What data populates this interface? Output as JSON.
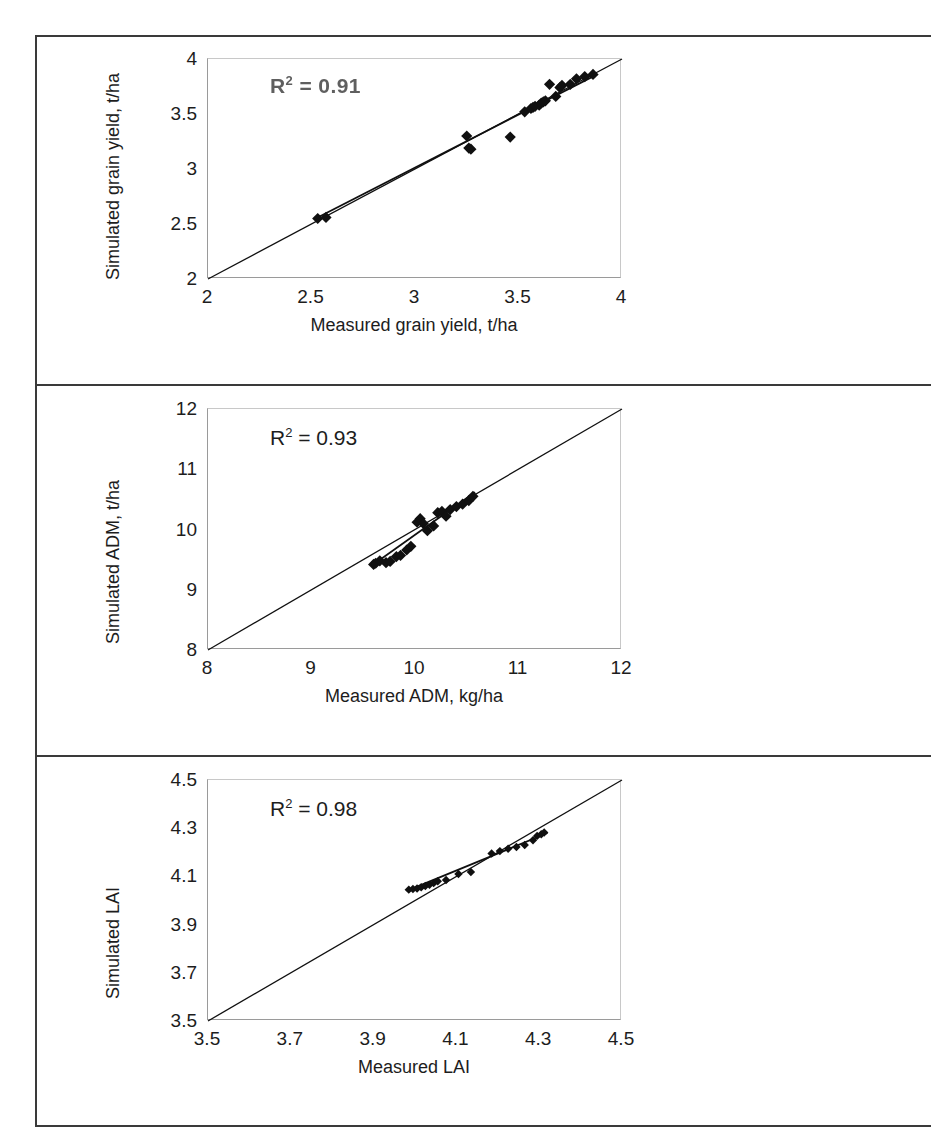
{
  "figure": {
    "type": "multi-panel-scatter-figure",
    "panel_count": 3,
    "frame_color": "#3a3a3a",
    "marker_color": "#101010",
    "line_color": "#101010"
  },
  "chart_data": [
    {
      "type": "scatter",
      "panel": 1,
      "title": "",
      "xlabel": "Measured grain yield, t/ha",
      "ylabel": "Simulated grain yield, t/ha",
      "xlim": [
        2,
        4
      ],
      "ylim": [
        2,
        4
      ],
      "xticks": [
        "2",
        "2.5",
        "3",
        "3.5",
        "4"
      ],
      "xtick_values": [
        2,
        2.5,
        3,
        3.5,
        4
      ],
      "yticks": [
        "2",
        "2.5",
        "3",
        "3.5",
        "4"
      ],
      "ytick_values": [
        2,
        2.5,
        3,
        3.5,
        4
      ],
      "grid": false,
      "legend": "none",
      "annotation": "R2 = 0.91",
      "annotation_r": "R",
      "annotation_sup": "2",
      "annotation_rest": " = 0.91",
      "annotation_note": "faint/degraded print, renders close to 'R2 = 0.91'",
      "reference_line": {
        "name": "1:1 line",
        "from": [
          2,
          2
        ],
        "to": [
          4,
          4
        ]
      },
      "fit_line": {
        "name": "regression line",
        "from": [
          2.52,
          2.55
        ],
        "to": [
          3.88,
          3.86
        ]
      },
      "points_x": [
        2.53,
        2.57,
        3.25,
        3.26,
        3.27,
        3.46,
        3.53,
        3.56,
        3.57,
        3.58,
        3.6,
        3.61,
        3.62,
        3.63,
        3.65,
        3.68,
        3.7,
        3.71,
        3.75,
        3.78,
        3.82,
        3.86
      ],
      "points_y": [
        2.55,
        2.56,
        3.3,
        3.19,
        3.18,
        3.29,
        3.52,
        3.55,
        3.56,
        3.57,
        3.58,
        3.6,
        3.61,
        3.62,
        3.77,
        3.66,
        3.74,
        3.76,
        3.77,
        3.82,
        3.84,
        3.86
      ]
    },
    {
      "type": "scatter",
      "panel": 2,
      "title": "",
      "xlabel": "Measured ADM, kg/ha",
      "ylabel": "Simulated ADM, t/ha",
      "xlim": [
        8,
        12
      ],
      "ylim": [
        8,
        12
      ],
      "xticks": [
        "8",
        "9",
        "10",
        "11",
        "12"
      ],
      "xtick_values": [
        8,
        9,
        10,
        11,
        12
      ],
      "yticks": [
        "8",
        "9",
        "10",
        "11",
        "12"
      ],
      "ytick_values": [
        8,
        9,
        10,
        11,
        12
      ],
      "grid": false,
      "legend": "none",
      "annotation": "R2 = 0.93",
      "annotation_r": "R",
      "annotation_sup": "2",
      "annotation_rest": " = 0.93",
      "reference_line": {
        "name": "1:1 line",
        "from": [
          8,
          8
        ],
        "to": [
          12,
          12
        ]
      },
      "fit_line": {
        "name": "regression line",
        "from": [
          9.58,
          9.4
        ],
        "to": [
          10.58,
          10.62
        ]
      },
      "points_x": [
        9.6,
        9.62,
        9.66,
        9.72,
        9.76,
        9.82,
        9.86,
        9.92,
        9.96,
        10.02,
        10.05,
        10.08,
        10.12,
        10.18,
        10.22,
        10.26,
        10.3,
        10.34,
        10.4,
        10.46,
        10.52,
        10.56
      ],
      "points_y": [
        9.42,
        9.44,
        9.48,
        9.45,
        9.47,
        9.55,
        9.57,
        9.66,
        9.72,
        10.12,
        10.18,
        10.1,
        9.98,
        10.06,
        10.28,
        10.3,
        10.22,
        10.33,
        10.38,
        10.42,
        10.48,
        10.55
      ]
    },
    {
      "type": "scatter",
      "panel": 3,
      "title": "",
      "xlabel": "Measured LAI",
      "ylabel": "Simulated LAI",
      "xlim": [
        3.5,
        4.5
      ],
      "ylim": [
        3.5,
        4.5
      ],
      "xticks": [
        "3.5",
        "3.7",
        "3.9",
        "4.1",
        "4.3",
        "4.5"
      ],
      "xtick_values": [
        3.5,
        3.7,
        3.9,
        4.1,
        4.3,
        4.5
      ],
      "yticks": [
        "3.5",
        "3.7",
        "3.9",
        "4.1",
        "4.3",
        "4.5"
      ],
      "ytick_values": [
        3.5,
        3.7,
        3.9,
        4.1,
        4.3,
        4.5
      ],
      "grid": false,
      "legend": "none",
      "annotation": "R2 = 0.98",
      "annotation_r": "R",
      "annotation_sup": "2",
      "annotation_rest": " = 0.98",
      "reference_line": {
        "name": "1:1 line",
        "from": [
          3.5,
          3.5
        ],
        "to": [
          4.5,
          4.5
        ]
      },
      "fit_line": {
        "name": "regression line",
        "from": [
          3.98,
          4.04
        ],
        "to": [
          4.32,
          4.28
        ]
      },
      "points_x": [
        3.985,
        3.995,
        4.005,
        4.015,
        4.025,
        4.035,
        4.045,
        4.055,
        4.075,
        4.105,
        4.135,
        4.185,
        4.205,
        4.225,
        4.245,
        4.265,
        4.285,
        4.295,
        4.305,
        4.312
      ],
      "points_y": [
        4.045,
        4.048,
        4.05,
        4.055,
        4.06,
        4.065,
        4.072,
        4.08,
        4.085,
        4.11,
        4.118,
        4.195,
        4.205,
        4.215,
        4.222,
        4.23,
        4.25,
        4.268,
        4.275,
        4.282
      ]
    }
  ]
}
